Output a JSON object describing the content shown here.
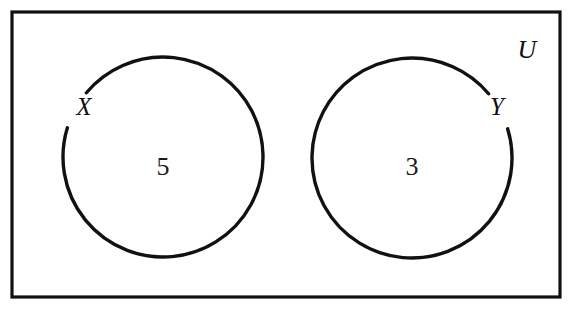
{
  "diagram": {
    "background_color": "#ffffff",
    "stroke_color": "#111111",
    "universe": {
      "label": "U",
      "label_x": 527,
      "label_y": 58,
      "label_size": 26,
      "rect": {
        "x": 12,
        "y": 12,
        "width": 548,
        "height": 285
      },
      "stroke_width": 3.2
    },
    "sets": [
      {
        "name": "X",
        "label": "X",
        "label_x": 84,
        "label_y": 115,
        "label_size": 25,
        "count": "5",
        "count_x": 163,
        "count_y": 175,
        "count_size": 26,
        "circle": {
          "cx": 163,
          "cy": 157,
          "r": 100
        },
        "stroke_width": 3.4,
        "gap_start_deg": 140,
        "gap_end_deg": 163
      },
      {
        "name": "Y",
        "label": "Y",
        "label_x": 497,
        "label_y": 115,
        "label_size": 25,
        "count": "3",
        "count_x": 412,
        "count_y": 175,
        "count_size": 26,
        "circle": {
          "cx": 412,
          "cy": 158,
          "r": 100
        },
        "stroke_width": 3.4,
        "gap_start_deg": 17,
        "gap_end_deg": 40
      }
    ]
  },
  "chart_data": {
    "type": "diagram",
    "diagram_kind": "venn",
    "universal_set": "U",
    "sets": [
      "X",
      "Y"
    ],
    "categories": [
      "X",
      "Y"
    ],
    "values": [
      5,
      3
    ],
    "region_counts": [
      {
        "region": "X only",
        "label": "5",
        "value": 5
      },
      {
        "region": "Y only",
        "label": "3",
        "value": 3
      }
    ],
    "intersection": "none (disjoint circles)",
    "annotations": [
      "U",
      "X",
      "Y",
      "5",
      "3"
    ],
    "legend": "none",
    "grid": false
  }
}
